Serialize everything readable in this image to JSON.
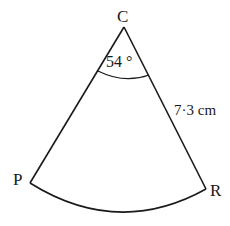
{
  "diagram": {
    "type": "sector",
    "vertices": {
      "center": {
        "label": "C",
        "x": 124,
        "y": 27
      },
      "left": {
        "label": "P",
        "x": 30,
        "y": 183
      },
      "right": {
        "label": "R",
        "x": 206,
        "y": 189
      }
    },
    "angle": {
      "value": "54 °",
      "at": "C"
    },
    "radius": {
      "value": "7·3 cm",
      "side": "CR"
    },
    "stroke_color": "#1a1a1a",
    "background_color": "#ffffff"
  }
}
